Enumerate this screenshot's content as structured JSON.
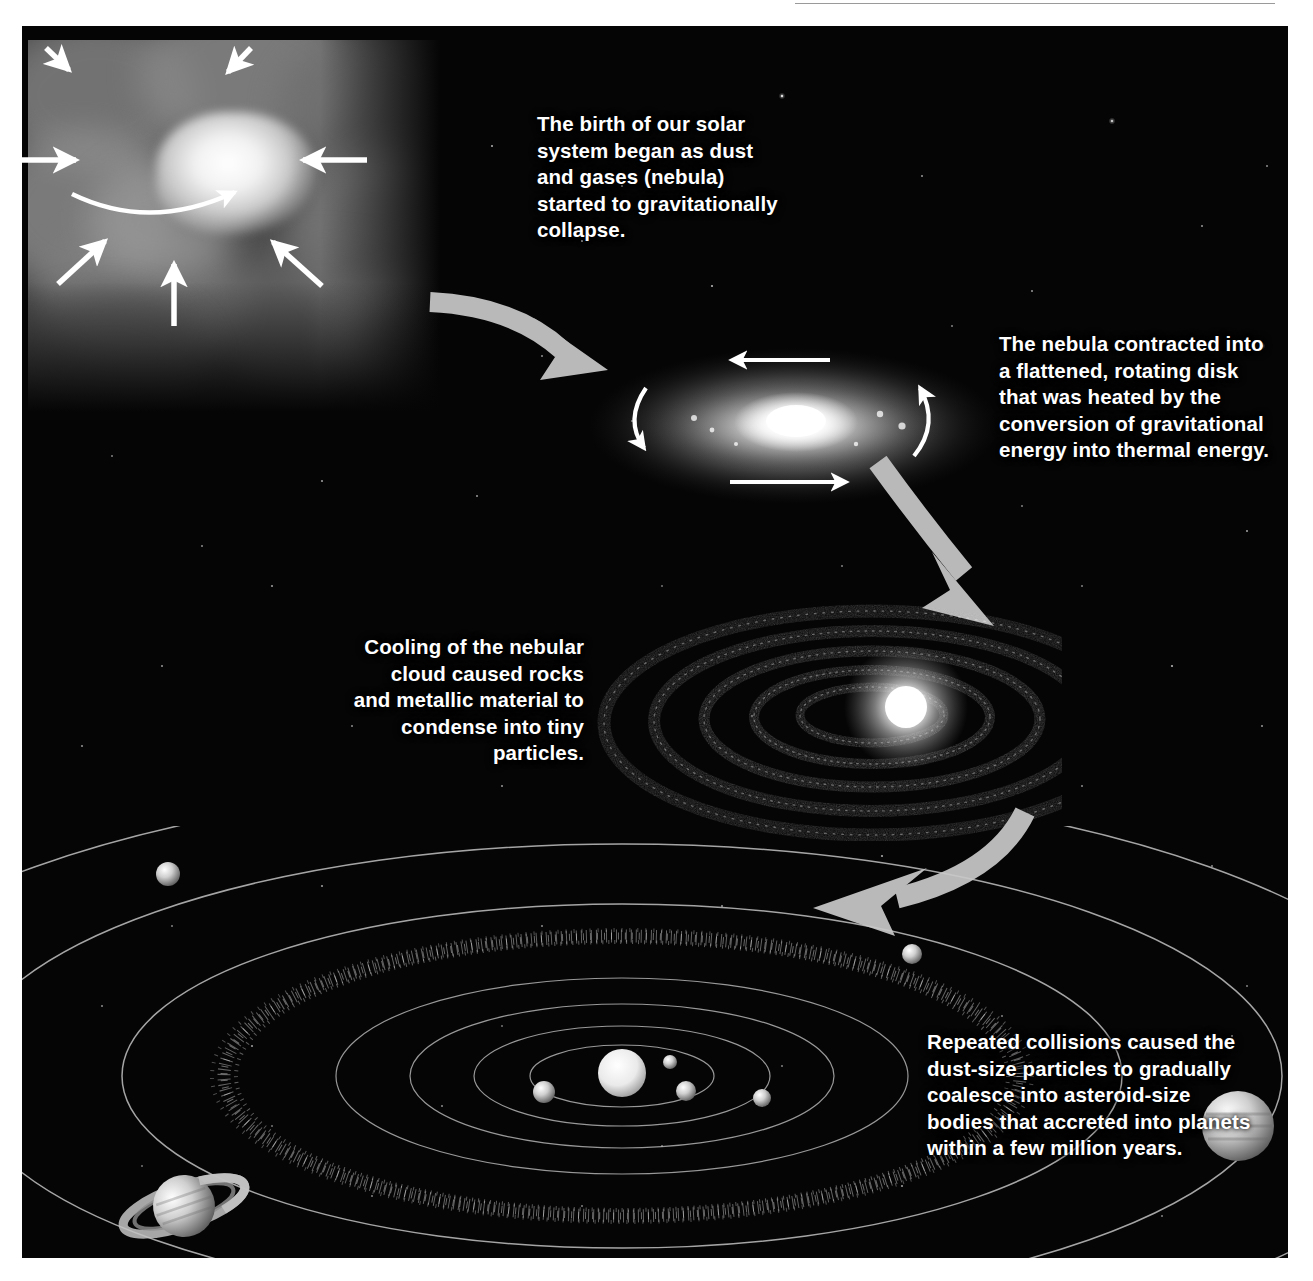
{
  "figure": {
    "background_color": "#050506",
    "caption_color": "#ffffff",
    "arrow_color": "#b9b9b9"
  },
  "stages": [
    {
      "id": "nebula",
      "name": "collapsing-nebula",
      "caption": "The birth of our solar\nsystem began as dust\nand gases (nebula)\nstarted to gravitationally\ncollapse.",
      "arrows_inward": 7,
      "rotation_arrows": 1
    },
    {
      "id": "disk",
      "name": "flattened-rotating-disk",
      "caption": "The nebula contracted into\na flattened, rotating disk\nthat was heated by the\nconversion of gravitational\nenergy into thermal energy.",
      "rotation_arrows": 4
    },
    {
      "id": "rings",
      "name": "condensing-dust-rings",
      "caption": "Cooling of the nebular\ncloud caused rocks\nand metallic material to\ncondense into tiny\nparticles.",
      "ring_count": 5
    },
    {
      "id": "solar-system",
      "name": "accreted-planetary-system",
      "caption": "Repeated collisions caused the\ndust-size particles to gradually\ncoalesce into asteroid-size\nbodies that accreted into planets\nwithin a few million years.",
      "orbit_count": 9
    }
  ],
  "connectors": [
    {
      "name": "nebula-to-disk",
      "from": "nebula",
      "to": "disk",
      "direction": "down-right"
    },
    {
      "name": "disk-to-rings",
      "from": "disk",
      "to": "rings",
      "direction": "down-right"
    },
    {
      "name": "rings-to-solar-system",
      "from": "rings",
      "to": "solar-system",
      "direction": "down-left"
    }
  ]
}
